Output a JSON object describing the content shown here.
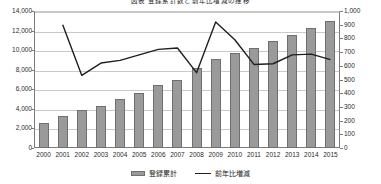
{
  "chart_data": {
    "type": "bar",
    "title": "図表 登録累計数と前年比増減の推移",
    "xlabel": "",
    "ylabel": "",
    "grid": true,
    "legend_position": "bottom",
    "categories": [
      "2000",
      "2001",
      "2002",
      "2003",
      "2004",
      "2005",
      "2006",
      "2007",
      "2008",
      "2009",
      "2010",
      "2011",
      "2012",
      "2013",
      "2014",
      "2015"
    ],
    "ylim": [
      0,
      14000
    ],
    "y2lim": [
      0,
      1000
    ],
    "yticks": [
      "0",
      "2,000",
      "4,000",
      "6,000",
      "8,000",
      "10,000",
      "12,000",
      "14,000"
    ],
    "y2ticks": [
      "0",
      "100",
      "200",
      "300",
      "400",
      "500",
      "600",
      "700",
      "800",
      "900",
      "1,000"
    ],
    "series": [
      {
        "name": "登録累計",
        "kind": "bar",
        "axis": "left",
        "color": "#9a9a9a",
        "values": [
          2600,
          3300,
          3900,
          4300,
          5000,
          5600,
          6400,
          7000,
          8200,
          9100,
          9700,
          10200,
          10900,
          11600,
          12300,
          13000
        ]
      },
      {
        "name": "前年比増減",
        "kind": "line",
        "axis": "right",
        "color": "#1f1f1f",
        "values": [
          null,
          900,
          530,
          620,
          640,
          680,
          720,
          730,
          550,
          920,
          790,
          610,
          615,
          680,
          685,
          645
        ]
      }
    ]
  },
  "legend": {
    "items": [
      {
        "label": "登録累計"
      },
      {
        "label": "前年比増減"
      }
    ]
  }
}
